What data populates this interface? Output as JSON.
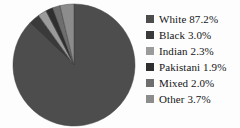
{
  "chart_data": {
    "type": "pie",
    "title": "",
    "subtitle": "",
    "xlabel": "",
    "ylabel": "",
    "legend_position": "right",
    "grid": false,
    "start_angle_deg": 0,
    "direction": "clockwise",
    "categories": [
      "White",
      "Black",
      "Indian",
      "Pakistani",
      "Mixed",
      "Other"
    ],
    "values": [
      87.2,
      3.0,
      2.3,
      1.9,
      2.0,
      3.7
    ],
    "value_unit": "%",
    "colors": [
      "#4d4d4d",
      "#3a3a3a",
      "#9b9b9b",
      "#2f2f2f",
      "#6e6e6e",
      "#8c8c8c"
    ],
    "labels": [
      "White 87.2%",
      "Black 3.0%",
      "Indian 2.3%",
      "Pakistani 1.9%",
      "Mixed 2.0%",
      "Other 3.7%"
    ]
  },
  "legend": {
    "items": [
      {
        "label": "White 87.2%",
        "color": "#4d4d4d",
        "swatch_name": "legend-swatch-white"
      },
      {
        "label": "Black 3.0%",
        "color": "#3a3a3a",
        "swatch_name": "legend-swatch-black"
      },
      {
        "label": "Indian 2.3%",
        "color": "#9b9b9b",
        "swatch_name": "legend-swatch-indian"
      },
      {
        "label": "Pakistani 1.9%",
        "color": "#2f2f2f",
        "swatch_name": "legend-swatch-pakistani"
      },
      {
        "label": "Mixed 2.0%",
        "color": "#6e6e6e",
        "swatch_name": "legend-swatch-mixed"
      },
      {
        "label": "Other 3.7%",
        "color": "#8c8c8c",
        "swatch_name": "legend-swatch-other"
      }
    ]
  },
  "pie": {
    "center_x": 66,
    "center_y": 64,
    "radius": 61,
    "outline_color": "#3f3f3f",
    "background": "#fdfdfd"
  }
}
